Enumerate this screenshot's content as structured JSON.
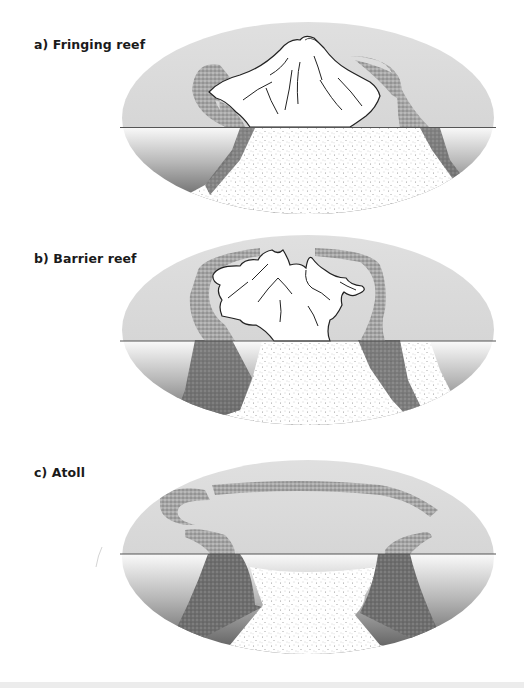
{
  "figure": {
    "panels": [
      {
        "id": "a",
        "label": "a)  Fringing reef",
        "name": "fringing-reef"
      },
      {
        "id": "b",
        "label": "b)  Barrier reef",
        "name": "barrier-reef"
      },
      {
        "id": "c",
        "label": "c)  Atoll",
        "name": "atoll"
      }
    ],
    "colors": {
      "sky": "#dcdcdc",
      "horizon_line": "#555555",
      "water_top": "#f2f2f2",
      "water_bottom": "#3a3a3a",
      "reef": "#9a9a9a",
      "island": "#ffffff",
      "island_outline": "#222222",
      "seafloor_stipple": "#8a8a8a"
    }
  }
}
